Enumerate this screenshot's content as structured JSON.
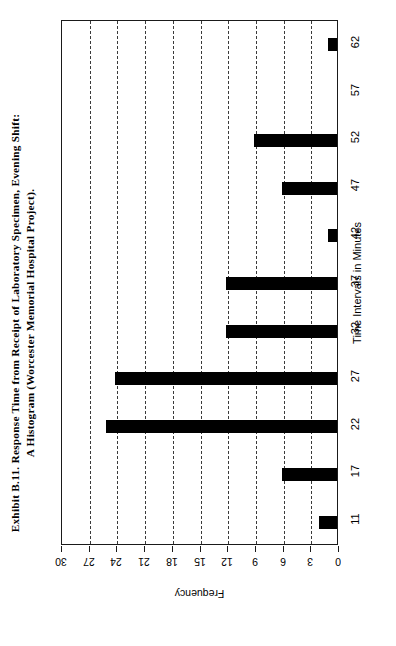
{
  "title": {
    "line1": "Exhibit B.11. Response Time from Receipt of Laboratory Specimen, Evening Shift:",
    "line2": "A Histogram (Worcester Memorial Hospital Project).",
    "full": "Exhibit B.11. Response Time from Receipt of Laboratory Specimen, Evening Shift:\nA Histogram (Worcester Memorial Hospital Project)."
  },
  "axes": {
    "category_axis_title": "Time Intervals in Minutes",
    "value_axis_title": "Frequency"
  },
  "colors": {
    "bar": "#000000",
    "axis": "#1a1a1a",
    "grid": "#3a3a3a",
    "background": "#ffffff"
  },
  "chart_data": {
    "type": "bar",
    "orientation": "horizontal",
    "title": "Exhibit B.11. Response Time from Receipt of Laboratory Specimen, Evening Shift: A Histogram (Worcester Memorial Hospital Project).",
    "xlabel": "Frequency",
    "ylabel": "Time Intervals in Minutes",
    "categories": [
      "11",
      "17",
      "22",
      "27",
      "32",
      "37",
      "42",
      "47",
      "52",
      "57",
      "62"
    ],
    "values": [
      2,
      6,
      25,
      24,
      12,
      12,
      1,
      6,
      9,
      0,
      1
    ],
    "xlim": [
      0,
      30
    ],
    "xticks": [
      30,
      27,
      24,
      21,
      18,
      15,
      12,
      9,
      6,
      3,
      0
    ],
    "xtick_labels": [
      "30",
      "27",
      "24",
      "21",
      "18",
      "15",
      "12",
      "9",
      "6",
      "3",
      "0"
    ],
    "grid": true,
    "grid_axis": "value",
    "grid_style": "dashed",
    "value_axis_reversed": true,
    "legend": null,
    "rotated_page": true
  }
}
